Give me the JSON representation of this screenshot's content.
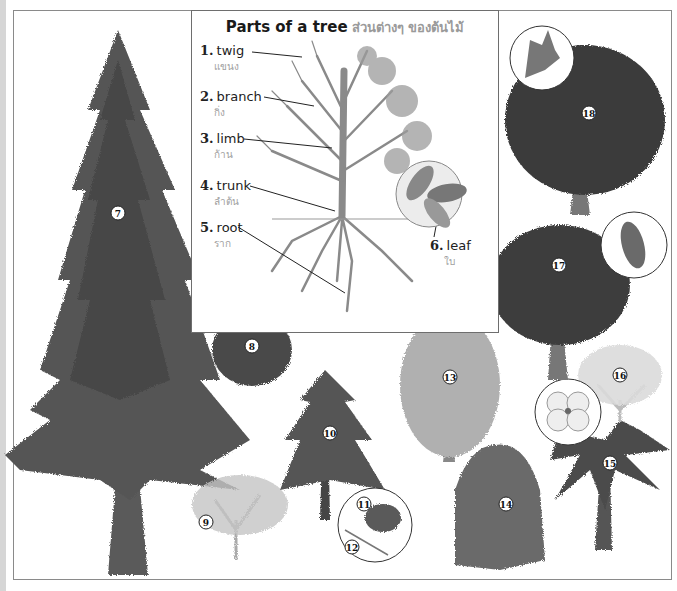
{
  "inset": {
    "title": "Parts of a tree",
    "title_thai": "ส่วนต่างๆ ของต้นไม้",
    "parts": [
      {
        "num": "1.",
        "label": "twig",
        "thai": "แขนง"
      },
      {
        "num": "2.",
        "label": "branch",
        "thai": "กิ่ง"
      },
      {
        "num": "3.",
        "label": "limb",
        "thai": "ก้าน"
      },
      {
        "num": "4.",
        "label": "trunk",
        "thai": "ลำต้น"
      },
      {
        "num": "5.",
        "label": "root",
        "thai": "ราก"
      },
      {
        "num": "6.",
        "label": "leaf",
        "thai": "ใบ"
      }
    ]
  },
  "trees": [
    {
      "num": "7",
      "kind": "tall-conifer"
    },
    {
      "num": "8",
      "kind": "small-twin-trunk-tree"
    },
    {
      "num": "9",
      "kind": "pale-shrub-tree"
    },
    {
      "num": "10",
      "kind": "pine"
    },
    {
      "num": "11",
      "kind": "pine-cone-detail"
    },
    {
      "num": "12",
      "kind": "pine-needle-detail"
    },
    {
      "num": "13",
      "kind": "pale-broadleaf-tree"
    },
    {
      "num": "14",
      "kind": "weeping-willow"
    },
    {
      "num": "15",
      "kind": "palm"
    },
    {
      "num": "16",
      "kind": "flowering-dogwood"
    },
    {
      "num": "17",
      "kind": "round-broadleaf-tree"
    },
    {
      "num": "18",
      "kind": "oak"
    }
  ],
  "colors": {
    "frame": "#8a8a8a",
    "ink": "#1a1a1a",
    "thai_text": "#9a9a9a",
    "foliage_dark": "#4a4a4a",
    "foliage_mid": "#6e6e6e",
    "foliage_light": "#a8a8a8"
  }
}
